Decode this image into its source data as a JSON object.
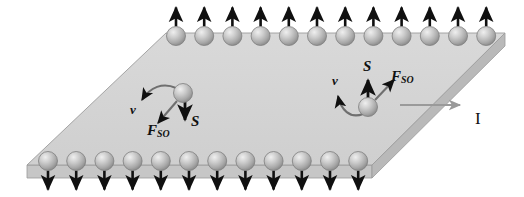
{
  "figure": {
    "type": "physics-diagram",
    "colors": {
      "slab_top": "#d3d3d3",
      "slab_side": "#b9b9b9",
      "slab_front": "#c6c6c6",
      "slab_outline": "#8a8a8a",
      "sphere_light": "#e6e6e6",
      "sphere_mid": "#b5b5b5",
      "sphere_dark": "#8f8f8f",
      "arrow_black": "#101010",
      "arrow_gray": "#9a9a9a",
      "background": "#ffffff"
    }
  },
  "slab": {
    "name": "conducting-slab",
    "top_face": [
      [
        166,
        33
      ],
      [
        505,
        33
      ],
      [
        372,
        165
      ],
      [
        27,
        165
      ]
    ],
    "thickness": 13,
    "edge_counts": {
      "top": 12,
      "bottom": 12
    }
  },
  "edge_spheres": {
    "top_row": {
      "count": 12,
      "arrow_direction": "up",
      "start_x": 176,
      "spacing": 28.2,
      "y": 36,
      "radius": 9.5,
      "arrow_length": 19
    },
    "bottom_row": {
      "count": 12,
      "arrow_direction": "down",
      "start_x": 48,
      "spacing": 28.2,
      "y": 161,
      "radius": 9.5,
      "arrow_length": 19
    }
  },
  "carriers": [
    {
      "name": "left-carrier",
      "cx": 183,
      "cy": 93,
      "radius": 9.5,
      "spin_label": "S",
      "spin_direction": "down",
      "velocity_label": "v",
      "force_label": "F",
      "force_subscript": "SO",
      "force_direction": "down-left",
      "labels": {
        "v": {
          "text": "v",
          "x": 133,
          "y": 110
        },
        "S": {
          "text": "S",
          "x": 192,
          "y": 122
        },
        "F": {
          "text": "F",
          "sub": "SO",
          "x": 152,
          "y": 128
        }
      }
    },
    {
      "name": "right-carrier",
      "cx": 368,
      "cy": 107,
      "radius": 9.5,
      "spin_label": "S",
      "spin_direction": "up",
      "velocity_label": "v",
      "force_label": "F",
      "force_subscript": "SO",
      "force_direction": "up-right",
      "labels": {
        "v": {
          "text": "v",
          "x": 335,
          "y": 80
        },
        "S": {
          "text": "S",
          "x": 363,
          "y": 66
        },
        "F": {
          "text": "F",
          "sub": "SO",
          "x": 392,
          "y": 78
        }
      }
    }
  ],
  "current": {
    "name": "current-indicator",
    "label": "I",
    "label_x": 474,
    "label_y": 110,
    "arrow_from": [
      400,
      105
    ],
    "arrow_to": [
      462,
      105
    ],
    "color": "#9a9a9a"
  }
}
